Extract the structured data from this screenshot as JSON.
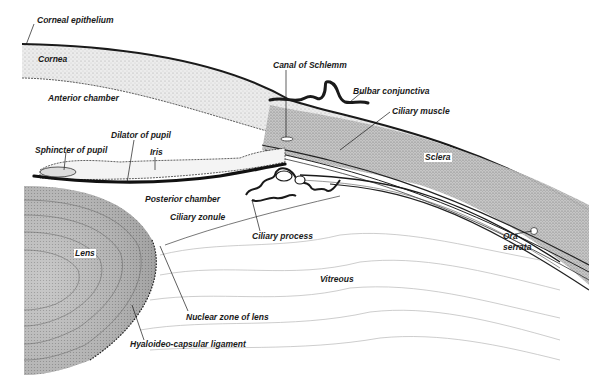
{
  "diagram": {
    "style": "monochrome engraving",
    "colors": {
      "ink": "#1a1a1a",
      "background": "#ffffff",
      "tissue_light": "#e6e6e6",
      "tissue_mid": "#bdbdbd",
      "tissue_dark": "#8a8a8a"
    },
    "labels": [
      {
        "id": "corneal-epithelium",
        "text": "Corneal epithelium",
        "x": 37,
        "y": 21
      },
      {
        "id": "cornea",
        "text": "Cornea",
        "x": 38,
        "y": 58
      },
      {
        "id": "anterior-chamber",
        "text": "Anterior chamber",
        "x": 48,
        "y": 96
      },
      {
        "id": "canal-of-schlemm",
        "text": "Canal of Schlemm",
        "x": 273,
        "y": 64
      },
      {
        "id": "bulbar-conjunctiva",
        "text": "Bulbar conjunctiva",
        "x": 353,
        "y": 87
      },
      {
        "id": "ciliary-muscle",
        "text": "Ciliary muscle",
        "x": 392,
        "y": 109
      },
      {
        "id": "dilator-of-pupil",
        "text": "Dilator of pupil",
        "x": 111,
        "y": 134
      },
      {
        "id": "sphincter-of-pupil",
        "text": "Sphincter of pupil",
        "x": 35,
        "y": 147
      },
      {
        "id": "iris",
        "text": "Iris",
        "x": 150,
        "y": 151
      },
      {
        "id": "sclera",
        "text": "Sclera",
        "x": 425,
        "y": 154
      },
      {
        "id": "posterior-chamber",
        "text": "Posterior chamber",
        "x": 145,
        "y": 197
      },
      {
        "id": "ciliary-zonule",
        "text": "Ciliary zonule",
        "x": 170,
        "y": 214
      },
      {
        "id": "ciliary-process",
        "text": "Ciliary process",
        "x": 252,
        "y": 233
      },
      {
        "id": "ora-serrata",
        "text": "Ora\nserrata",
        "x": 503,
        "y": 233
      },
      {
        "id": "lens",
        "text": "Lens",
        "x": 75,
        "y": 251
      },
      {
        "id": "vitreous",
        "text": "Vitreous",
        "x": 320,
        "y": 275
      },
      {
        "id": "nuclear-zone-of-lens",
        "text": "Nuclear zone of lens",
        "x": 187,
        "y": 314
      },
      {
        "id": "hyaloideo-capsular-ligament",
        "text": "Hyaloideo-capsular ligament",
        "x": 130,
        "y": 341
      }
    ],
    "label_text": {
      "corneal_epithelium": "Corneal epithelium",
      "cornea": "Cornea",
      "anterior_chamber": "Anterior chamber",
      "canal_of_schlemm": "Canal of Schlemm",
      "bulbar_conjunctiva": "Bulbar conjunctiva",
      "ciliary_muscle": "Ciliary muscle",
      "dilator_of_pupil": "Dilator of pupil",
      "sphincter_of_pupil": "Sphincter of pupil",
      "iris": "Iris",
      "sclera": "Sclera",
      "posterior_chamber": "Posterior chamber",
      "ciliary_zonule": "Ciliary zonule",
      "ciliary_process": "Ciliary process",
      "ora": "Ora",
      "serrata": "serrata",
      "lens": "Lens",
      "vitreous": "Vitreous",
      "nuclear_zone_of_lens": "Nuclear zone of lens",
      "hyaloideo_capsular_ligament": "Hyaloideo-capsular ligament"
    }
  }
}
